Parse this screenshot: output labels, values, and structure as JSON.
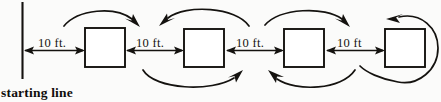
{
  "figure": {
    "start_label": "starting  line",
    "background_color": "#fbfbfa",
    "ink_color": "#14120f"
  },
  "distance_labels": [
    {
      "text": "10 ft.",
      "x": 38,
      "y": 36
    },
    {
      "text": "10 ft.",
      "x": 136,
      "y": 36
    },
    {
      "text": "10 ft.",
      "x": 236,
      "y": 36
    },
    {
      "text": "10 ft",
      "x": 337,
      "y": 36
    }
  ],
  "boxes": [
    {
      "name": "box-1",
      "x": 85,
      "y": 28,
      "width": 40,
      "height": 39
    },
    {
      "name": "box-2",
      "x": 184,
      "y": 29,
      "width": 40,
      "height": 38
    },
    {
      "name": "box-3",
      "x": 284,
      "y": 29,
      "width": 40,
      "height": 38
    },
    {
      "name": "box-4",
      "x": 385,
      "y": 29,
      "width": 40,
      "height": 38
    }
  ],
  "starting_line": {
    "x": 22,
    "y_top": 2,
    "y_bottom": 79
  },
  "measure_segments": [
    {
      "name": "segment-start-to-box1",
      "x1": 22,
      "x2": 85,
      "y": 50,
      "heads": "both"
    },
    {
      "name": "segment-box1-to-box2",
      "x1": 125,
      "x2": 184,
      "y": 50,
      "heads": "both"
    },
    {
      "name": "segment-box2-to-box3",
      "x1": 224,
      "x2": 284,
      "y": 50,
      "heads": "both"
    },
    {
      "name": "segment-box3-to-box4",
      "x1": 324,
      "x2": 385,
      "y": 50,
      "heads": "both"
    }
  ],
  "motion_arcs": [
    {
      "name": "arc-top-forward-1",
      "direction": "right",
      "position": "above"
    },
    {
      "name": "arc-top-back-1",
      "direction": "left",
      "position": "above"
    },
    {
      "name": "arc-bottom-forward-1",
      "direction": "right",
      "position": "below"
    },
    {
      "name": "arc-top-forward-2",
      "direction": "right",
      "position": "above"
    },
    {
      "name": "arc-bottom-back-1",
      "direction": "left",
      "position": "below"
    },
    {
      "name": "arc-loop-around-box4",
      "direction": "left",
      "position": "around"
    }
  ]
}
